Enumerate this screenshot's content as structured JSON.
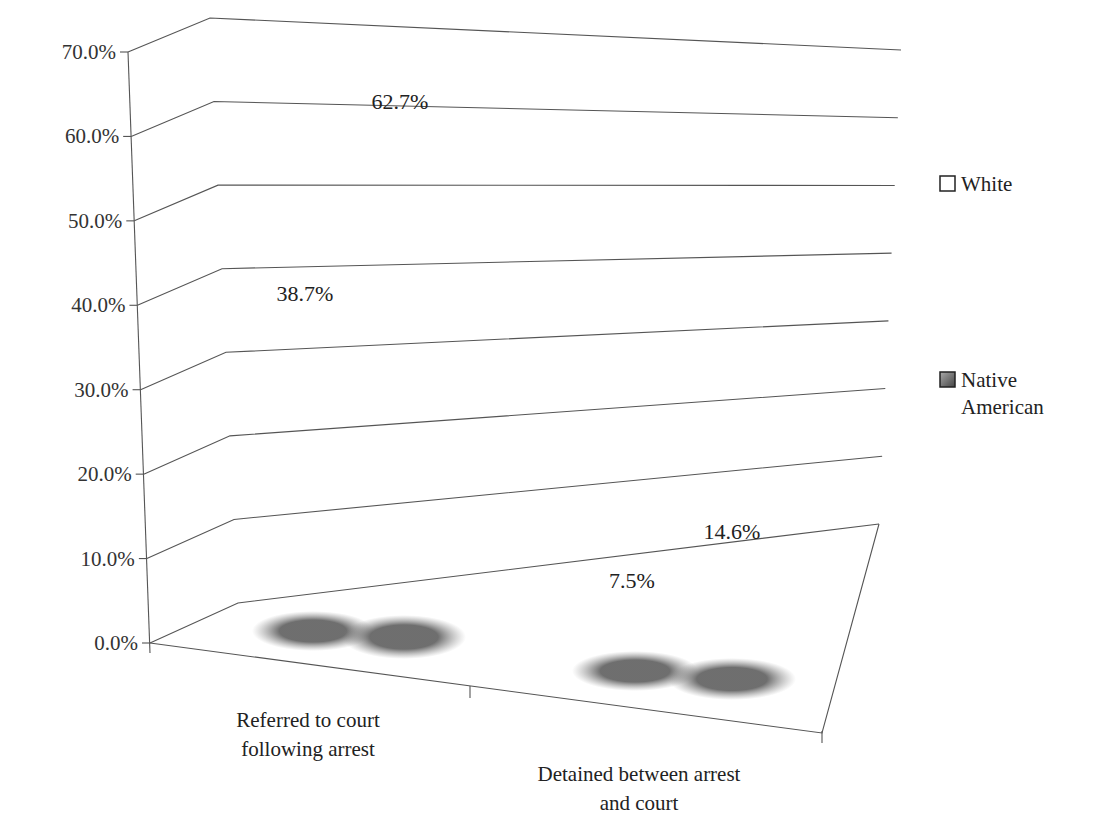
{
  "chart_data": {
    "type": "bar",
    "subtype": "3d-cone",
    "title": "",
    "xlabel": "",
    "ylabel": "",
    "ylim": [
      0,
      70
    ],
    "yticks": [
      "0.0%",
      "10.0%",
      "20.0%",
      "30.0%",
      "40.0%",
      "50.0%",
      "60.0%",
      "70.0%"
    ],
    "grid": true,
    "legend_position": "right",
    "categories": [
      "Referred to court following arrest",
      "Detained between arrest and court"
    ],
    "category_lines": [
      [
        "Referred to court",
        "following arrest"
      ],
      [
        "Detained between arrest",
        "and court"
      ]
    ],
    "series": [
      {
        "name": "White",
        "values": [
          38.7,
          7.5
        ],
        "labels": [
          "38.7%",
          "7.5%"
        ],
        "color": "#f2f2f2"
      },
      {
        "name": "Native American",
        "values": [
          62.7,
          14.6
        ],
        "labels": [
          "62.7%",
          "14.6%"
        ],
        "color": "#7a7a7a"
      }
    ],
    "legend": [
      {
        "label_lines": [
          "White"
        ]
      },
      {
        "label_lines": [
          "Native",
          "American"
        ]
      }
    ]
  }
}
